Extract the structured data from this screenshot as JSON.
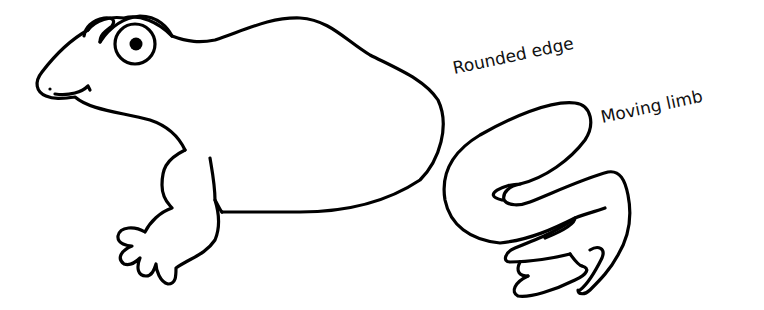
{
  "figure": {
    "subjects": [
      {
        "name": "frog",
        "description": "Line drawing of a frog in side view with large eye"
      },
      {
        "name": "limb",
        "description": "Detached S-shaped limb with hand-like end"
      }
    ],
    "labels": [
      {
        "text": "Rounded edge"
      },
      {
        "text": "Moving limb"
      }
    ],
    "colors": {
      "stroke": "#000000",
      "background": "#ffffff",
      "text": "#111111"
    }
  }
}
